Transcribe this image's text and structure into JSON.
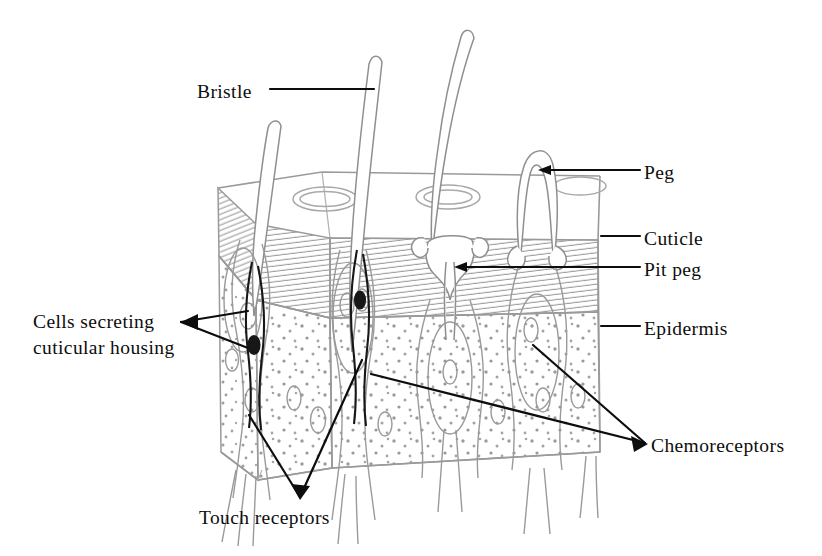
{
  "figure": {
    "background_color": "#ffffff",
    "ink_color": "#0d0d0d",
    "structure_line_color": "#8f8f8f",
    "width": 822,
    "height": 556
  },
  "labels": {
    "bristle": "Bristle",
    "peg": "Peg",
    "cuticle": "Cuticle",
    "pit_peg": "Pit peg",
    "epidermis": "Epidermis",
    "chemoreceptors": "Chemoreceptors",
    "touch_receptors": "Touch receptors",
    "cells_secreting": "Cells secreting\ncuticular housing"
  },
  "layers": [
    {
      "name": "cuticle",
      "label": "Cuticle",
      "fill": "#ffffff",
      "texture": "fine-parallel-hatching"
    },
    {
      "name": "epidermis",
      "label": "Epidermis",
      "fill": "#ffffff",
      "texture": "stipple-dots"
    }
  ],
  "sensilla": [
    {
      "name": "bristle-left",
      "type": "bristle",
      "label": "Bristle"
    },
    {
      "name": "bristle-center",
      "type": "bristle",
      "label": "Bristle"
    },
    {
      "name": "bristle-tall",
      "type": "bristle",
      "label": "Bristle"
    },
    {
      "name": "peg-right",
      "type": "peg",
      "label": "Peg"
    },
    {
      "name": "pit-peg-center",
      "type": "pit peg",
      "label": "Pit peg"
    }
  ],
  "receptors": [
    {
      "name": "touch-receptors",
      "label": "Touch receptors",
      "count_leaders": 2
    },
    {
      "name": "chemoreceptors",
      "label": "Chemoreceptors",
      "count_leaders": 2
    },
    {
      "name": "cells-secreting-cuticular-housing",
      "label": "Cells secreting cuticular housing",
      "count_leaders": 2
    }
  ]
}
